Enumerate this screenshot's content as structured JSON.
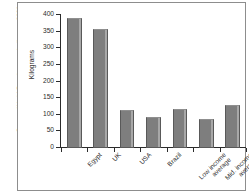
{
  "figure": {
    "source_note": "Source: World Development Indicators 2001"
  },
  "chart_data": {
    "type": "bar",
    "title": "",
    "xlabel": "",
    "ylabel": "Kilograms",
    "ylim": [
      0,
      400
    ],
    "yticks": [
      0,
      50,
      100,
      150,
      200,
      250,
      300,
      350,
      400
    ],
    "ytick_labels": [
      "0",
      "50",
      "100",
      "150",
      "200",
      "250",
      "300",
      "350",
      "400"
    ],
    "grid": false,
    "legend": "none",
    "bar_color": "#7e7e7e",
    "categories": [
      "Egypt",
      "UK",
      "USA",
      "Brazil",
      "Low income average",
      "Mid. income average",
      "High income average"
    ],
    "category_lines": [
      [
        "Egypt",
        ""
      ],
      [
        "UK",
        ""
      ],
      [
        "USA",
        ""
      ],
      [
        "Brazil",
        ""
      ],
      [
        "Low income",
        "average"
      ],
      [
        "Mid. income",
        "average"
      ],
      [
        "High income",
        "average"
      ]
    ],
    "values": [
      390,
      358,
      115,
      93,
      117,
      86,
      130
    ]
  }
}
